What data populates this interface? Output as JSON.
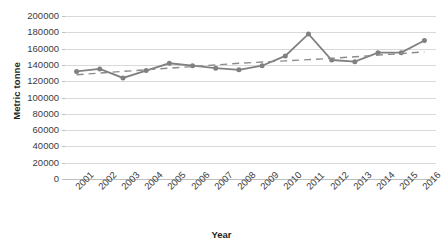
{
  "chart_data": {
    "type": "line",
    "title": "",
    "xlabel": "Year",
    "ylabel": "Metric tonne",
    "categories": [
      "2001",
      "2002",
      "2003",
      "2004",
      "2005",
      "2006",
      "2007",
      "2008",
      "2009",
      "2010",
      "2011",
      "2012",
      "2013",
      "2014",
      "2015",
      "2016"
    ],
    "ylim": [
      0,
      200000
    ],
    "ytick_step": 20000,
    "ytick_labels": [
      "0",
      "20000",
      "40000",
      "60000",
      "80000",
      "100000",
      "120000",
      "140000",
      "160000",
      "180000",
      "200000"
    ],
    "grid": true,
    "legend": "none",
    "series": [
      {
        "name": "Metric tonne",
        "style": "solid-line-with-markers",
        "color": "#808080",
        "values": [
          132000,
          135000,
          124000,
          133000,
          142000,
          139000,
          136000,
          134000,
          139000,
          151000,
          178000,
          146000,
          144000,
          155000,
          155000,
          170000
        ]
      },
      {
        "name": "Trendline",
        "style": "dashed",
        "color": "#8c8c8c",
        "values": [
          128000,
          130000,
          132000,
          134000,
          136000,
          138000,
          140000,
          142000,
          143500,
          145000,
          146500,
          148000,
          150000,
          152000,
          154000,
          156000
        ]
      }
    ]
  },
  "axis": {
    "y_title": "Metric tonne",
    "x_title": "Year"
  }
}
